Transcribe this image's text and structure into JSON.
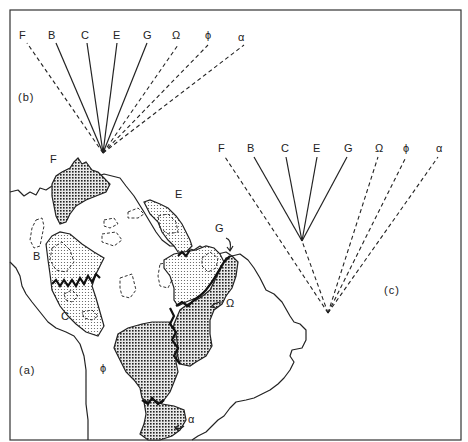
{
  "figure": {
    "panels": [
      {
        "id": "a",
        "label": "(a)",
        "kind": "map",
        "description": "Map of northern and central South America showing areas of endemism",
        "area_labels": [
          "F",
          "B",
          "E",
          "G",
          "C",
          "Ω",
          "ϕ",
          "α"
        ]
      },
      {
        "id": "b",
        "label": "(b)",
        "kind": "cladogram",
        "taxa": [
          "F",
          "B",
          "C",
          "E",
          "G",
          "Ω",
          "ϕ",
          "α"
        ],
        "solid_branches": [
          "B",
          "C",
          "E",
          "G"
        ],
        "dashed_branches": [
          "F",
          "Ω",
          "ϕ",
          "α"
        ],
        "structure": "single polytomy"
      },
      {
        "id": "c",
        "label": "(c)",
        "kind": "cladogram",
        "taxa": [
          "F",
          "B",
          "C",
          "E",
          "G",
          "Ω",
          "ϕ",
          "α"
        ],
        "solid_branches": [
          "B",
          "C",
          "E",
          "G"
        ],
        "dashed_branches": [
          "F",
          "Ω",
          "ϕ",
          "α"
        ],
        "structure": "B,C,E,G grouped as a clade nested in a basal polytomy"
      }
    ],
    "tree_b": {
      "label": "(b)",
      "tips": [
        "F",
        "B",
        "C",
        "E",
        "G",
        "Ω",
        "ϕ",
        "α"
      ]
    },
    "tree_c": {
      "label": "(c)",
      "tips": [
        "F",
        "B",
        "C",
        "E",
        "G",
        "Ω",
        "ϕ",
        "α"
      ]
    },
    "map": {
      "label": "(a)",
      "areas": {
        "F": "F",
        "B": "B",
        "E": "E",
        "G": "G",
        "C": "C",
        "omega": "Ω",
        "phi": "ϕ",
        "alpha": "α"
      }
    }
  }
}
